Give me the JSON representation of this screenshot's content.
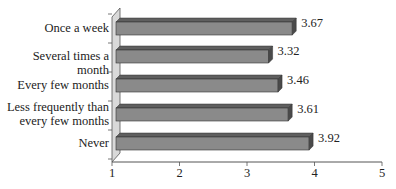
{
  "chart_data": {
    "type": "bar",
    "orientation": "horizontal",
    "style": "3d",
    "title": "",
    "xlabel": "",
    "ylabel": "",
    "categories": [
      "Once a week",
      "Several times a month",
      "Every few months",
      "Less frequently than\nevery few months",
      "Never"
    ],
    "values": [
      3.67,
      3.32,
      3.46,
      3.61,
      3.92
    ],
    "value_labels": [
      "3.67",
      "3.32",
      "3.46",
      "3.61",
      "3.92"
    ],
    "xlim": [
      1,
      5
    ],
    "x_ticks": [
      "1",
      "2",
      "3",
      "4",
      "5"
    ],
    "grid": false,
    "legend": null,
    "colors": {
      "bar_front": "#8a8a8a",
      "bar_top": "#5f5f5f",
      "bar_end": "#4a4a4a",
      "wall": "#d9d9d9",
      "axis": "#555555"
    }
  }
}
